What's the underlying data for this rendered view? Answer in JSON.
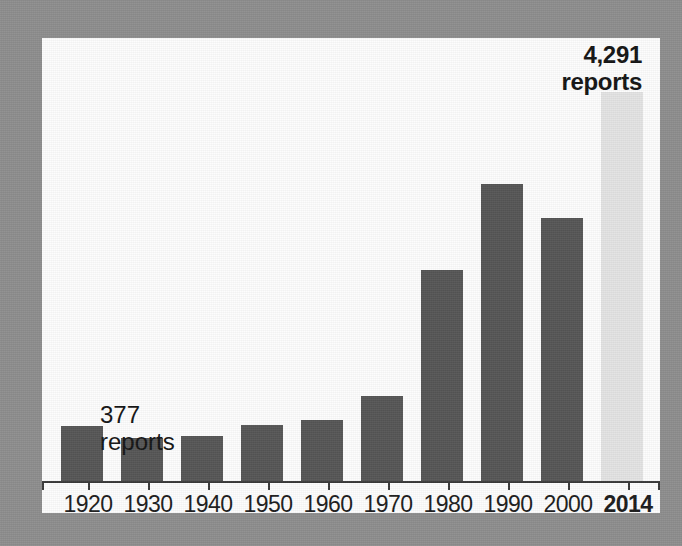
{
  "figure": {
    "background_color": "#8e8e8e",
    "panel_color": "#fdfdfd",
    "bar_color": "#565656",
    "highlight_bar_color": "#e3e3e3",
    "axis_color": "#3a3a3a"
  },
  "callouts": {
    "first": {
      "value": "377",
      "unit": "reports"
    },
    "last": {
      "value": "4,291",
      "unit": "reports"
    }
  },
  "chart_data": {
    "type": "bar",
    "title": "",
    "subtitle": "",
    "xlabel": "",
    "ylabel": "",
    "grid": false,
    "legend": "none",
    "ylim": [
      0,
      4291
    ],
    "categories": [
      "1920",
      "1930",
      "1940",
      "1950",
      "1960",
      "1970",
      "1980",
      "1990",
      "2000",
      "2014"
    ],
    "values": [
      377,
      281,
      296,
      384,
      436,
      736,
      1505,
      2418,
      2097,
      4291
    ],
    "bar_pixel_heights": [
      55,
      43,
      45,
      56,
      61,
      85,
      211,
      297,
      263,
      389
    ],
    "annotations": [
      {
        "category": "1920",
        "text": "377 reports",
        "bold": false
      },
      {
        "category": "2014",
        "text": "4,291 reports",
        "bold": true
      }
    ],
    "highlight_category": "2014",
    "tick_labels_bold": [
      "2014"
    ]
  }
}
